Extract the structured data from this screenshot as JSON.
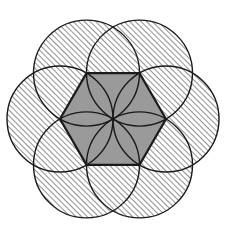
{
  "figure": {
    "type": "geometric-diagram",
    "canvas": {
      "width": 228,
      "height": 240,
      "background": "#ffffff"
    },
    "center": {
      "x": 113,
      "y": 119
    },
    "hexagon": {
      "name": "central-hexagon",
      "orientation": "flat-top",
      "circumradius": 53,
      "fill": "#9a9a9a",
      "stroke": "#1a1a1a",
      "stroke_width": 2.2,
      "vertex_angles_deg": [
        0,
        60,
        120,
        180,
        240,
        300
      ],
      "vertices": [
        {
          "label": "right",
          "x": 166,
          "y": 119
        },
        {
          "label": "top-right",
          "x": 139.5,
          "y": 73.1
        },
        {
          "label": "top-left",
          "x": 86.5,
          "y": 73.1
        },
        {
          "label": "left",
          "x": 60,
          "y": 119
        },
        {
          "label": "bottom-left",
          "x": 86.5,
          "y": 164.9
        },
        {
          "label": "bottom-right",
          "x": 139.5,
          "y": 164.9
        }
      ]
    },
    "circles": {
      "name": "six-vertex-circles",
      "count": 6,
      "radius": 53,
      "fill": "hatched-45-degree",
      "hatch_color": "#3a3a3a",
      "hatch_spacing_px": 4,
      "hatch_angle_deg": 45,
      "stroke": "#1a1a1a",
      "stroke_width": 1.4,
      "centers": [
        {
          "label": "circle-right",
          "x": 166,
          "y": 119
        },
        {
          "label": "circle-top-right",
          "x": 139.5,
          "y": 73.1
        },
        {
          "label": "circle-top-left",
          "x": 86.5,
          "y": 73.1
        },
        {
          "label": "circle-left",
          "x": 60,
          "y": 119
        },
        {
          "label": "circle-bottom-left",
          "x": 86.5,
          "y": 164.9
        },
        {
          "label": "circle-bottom-right",
          "x": 139.5,
          "y": 164.9
        }
      ]
    },
    "center_region": {
      "name": "central-white-hexagon",
      "fill": "#ffffff",
      "stroke": "#1a1a1a",
      "approx_radius": 14,
      "description": "white six-petal-bounded region at the common intersection of all six circles"
    },
    "extents": {
      "left_px": 12,
      "right_px": 214,
      "top_px": 12,
      "bottom_px": 226
    }
  }
}
